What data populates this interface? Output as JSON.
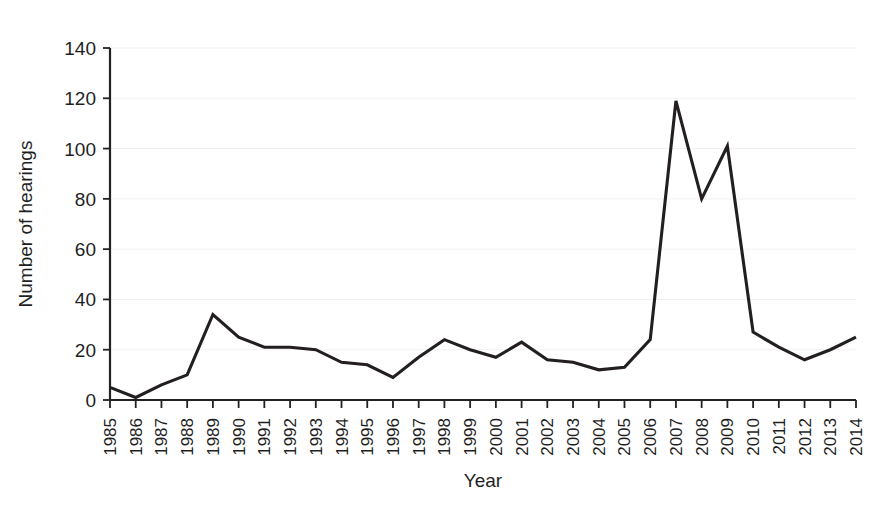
{
  "chart_data": {
    "type": "line",
    "title": "",
    "xlabel": "Year",
    "ylabel": "Number of hearings",
    "categories": [
      "1985",
      "1986",
      "1987",
      "1988",
      "1989",
      "1990",
      "1991",
      "1992",
      "1993",
      "1994",
      "1995",
      "1996",
      "1997",
      "1998",
      "1999",
      "2000",
      "2001",
      "2002",
      "2003",
      "2004",
      "2005",
      "2006",
      "2007",
      "2008",
      "2009",
      "2010",
      "2011",
      "2012",
      "2013",
      "2014"
    ],
    "values": [
      5,
      1,
      6,
      10,
      34,
      25,
      21,
      21,
      20,
      15,
      14,
      9,
      17,
      24,
      20,
      17,
      23,
      16,
      15,
      12,
      13,
      24,
      119,
      80,
      101,
      27,
      21,
      16,
      20,
      25
    ],
    "series": [
      {
        "name": "Number of hearings",
        "values": [
          5,
          1,
          6,
          10,
          34,
          25,
          21,
          21,
          20,
          15,
          14,
          9,
          17,
          24,
          20,
          17,
          23,
          16,
          15,
          12,
          13,
          24,
          119,
          80,
          101,
          27,
          21,
          16,
          20,
          25
        ]
      }
    ],
    "y_ticks": [
      0,
      20,
      40,
      60,
      80,
      100,
      120,
      140
    ],
    "ylim": [
      0,
      140
    ],
    "xlim": [
      "1985",
      "2014"
    ],
    "grid": true,
    "grid_axis": "y",
    "legend": false,
    "legend_position": "none",
    "line_color": "#231f20",
    "grid_color": "#f1f1f1",
    "axis_color": "#222222",
    "background_color": "#ffffff",
    "x_tick_label_rotation": -90,
    "annotations": []
  }
}
